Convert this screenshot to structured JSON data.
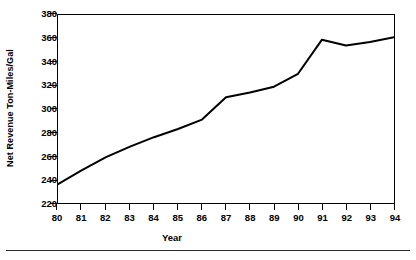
{
  "chart_data": {
    "type": "line",
    "title": "",
    "subtitle": "",
    "xlabel": "Year",
    "ylabel": "Net Revenue Ton-Miles/Gal",
    "categories": [
      "80",
      "81",
      "82",
      "83",
      "84",
      "85",
      "86",
      "87",
      "88",
      "89",
      "90",
      "91",
      "92",
      "93",
      "94"
    ],
    "x": [
      80,
      81,
      82,
      83,
      84,
      85,
      86,
      87,
      88,
      89,
      90,
      91,
      92,
      93,
      94
    ],
    "values": [
      236,
      248,
      259,
      268,
      276,
      283,
      291,
      310,
      314,
      319,
      330,
      359,
      354,
      357,
      361
    ],
    "series": [
      {
        "name": "Net Revenue Ton-Miles/Gal",
        "values": [
          236,
          248,
          259,
          268,
          276,
          283,
          291,
          310,
          314,
          319,
          330,
          359,
          354,
          357,
          361
        ]
      }
    ],
    "ylim": [
      220,
      380
    ],
    "yticks": [
      220,
      240,
      260,
      280,
      300,
      320,
      340,
      360,
      380
    ],
    "ytick_labels": [
      "220",
      "240",
      "260",
      "280",
      "300",
      "320",
      "340",
      "360",
      "380"
    ],
    "xlim": [
      80,
      94
    ],
    "xticks": [
      80,
      81,
      82,
      83,
      84,
      85,
      86,
      87,
      88,
      89,
      90,
      91,
      92,
      93,
      94
    ],
    "xtick_labels": [
      "80",
      "81",
      "82",
      "83",
      "84",
      "85",
      "86",
      "87",
      "88",
      "89",
      "90",
      "91",
      "92",
      "93",
      "94"
    ],
    "grid": false,
    "legend": false,
    "legend_position": "none",
    "line_color": "#000000",
    "line_width": 2,
    "markers": false,
    "annotations": []
  },
  "figure": {
    "footer_rule": true,
    "background_color": "#ffffff",
    "axis_color": "#000000"
  }
}
